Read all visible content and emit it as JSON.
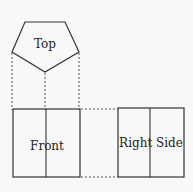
{
  "diagram": {
    "type": "orthographic-projection",
    "views": {
      "top": {
        "label": "Top"
      },
      "front": {
        "label": "Front"
      },
      "right": {
        "label": "Right Side"
      }
    },
    "colors": {
      "line": "#333333",
      "background": "#f8f8f8"
    }
  }
}
